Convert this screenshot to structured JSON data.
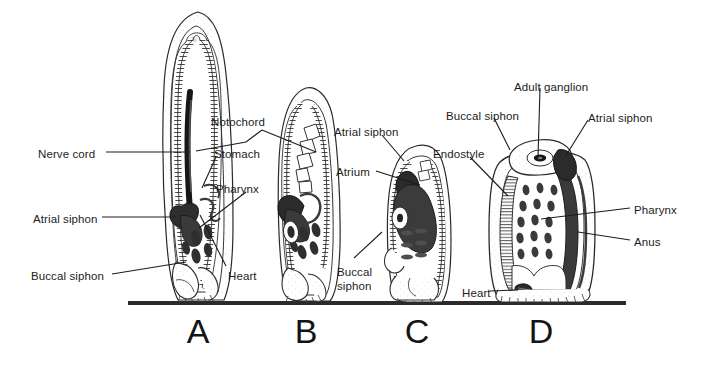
{
  "figure": {
    "type": "scientific-line-diagram",
    "background": "#ffffff",
    "ink": "#1c1c1c",
    "baseline": {
      "x1": 128,
      "x2": 626,
      "y": 303,
      "thickness": 4,
      "color": "#2b2b2b"
    }
  },
  "stages": [
    {
      "letter": "A",
      "cx": 198,
      "y": 312
    },
    {
      "letter": "B",
      "cx": 306,
      "y": 312
    },
    {
      "letter": "C",
      "cx": 417,
      "y": 312
    },
    {
      "letter": "D",
      "cx": 541,
      "y": 312
    }
  ],
  "labels": [
    {
      "id": "nerve-cord",
      "text": "Nerve cord",
      "x": 38,
      "y": 148,
      "align": "left"
    },
    {
      "id": "notochord",
      "text": "Notochord",
      "x": 211,
      "y": 116,
      "align": "left"
    },
    {
      "id": "stomach",
      "text": "Stomach",
      "x": 214,
      "y": 148,
      "align": "left"
    },
    {
      "id": "pharynx-a",
      "text": "Pharynx",
      "x": 216,
      "y": 183,
      "align": "left"
    },
    {
      "id": "atrial-siphon-a",
      "text": "Atrial siphon",
      "x": 33,
      "y": 213,
      "align": "left"
    },
    {
      "id": "buccal-siphon-a",
      "text": "Buccal siphon",
      "x": 31,
      "y": 270,
      "align": "left"
    },
    {
      "id": "heart-a",
      "text": "Heart",
      "x": 228,
      "y": 270,
      "align": "left"
    },
    {
      "id": "atrial-siphon-c",
      "text": "Atrial siphon",
      "x": 334,
      "y": 126,
      "align": "left"
    },
    {
      "id": "atrium-c",
      "text": "Atrium",
      "x": 336,
      "y": 166,
      "align": "left"
    },
    {
      "id": "buccal-siphon-c",
      "text": "Buccal\nsiphon",
      "x": 337,
      "y": 266,
      "align": "left"
    },
    {
      "id": "endostyle-d",
      "text": "Endostyle",
      "x": 433,
      "y": 148,
      "align": "left"
    },
    {
      "id": "buccal-siphon-d",
      "text": "Buccal siphon",
      "x": 446,
      "y": 110,
      "align": "left"
    },
    {
      "id": "adult-ganglion-d",
      "text": "Adult ganglion",
      "x": 514,
      "y": 81,
      "align": "left"
    },
    {
      "id": "atrial-siphon-d",
      "text": "Atrial siphon",
      "x": 588,
      "y": 112,
      "align": "left"
    },
    {
      "id": "pharynx-d",
      "text": "Pharynx",
      "x": 634,
      "y": 204,
      "align": "left"
    },
    {
      "id": "anus-d",
      "text": "Anus",
      "x": 634,
      "y": 236,
      "align": "left"
    },
    {
      "id": "heart-d",
      "text": "Heart",
      "x": 462,
      "y": 287,
      "align": "left"
    }
  ],
  "leaders": [
    {
      "id": "leader-nerve-cord",
      "points": "106,152 190,152"
    },
    {
      "id": "leader-notochord-a",
      "points": "262,130 246,142 196,151"
    },
    {
      "id": "leader-notochord-b",
      "points": "262,130 316,152"
    },
    {
      "id": "leader-stomach",
      "points": "216,157 202,188"
    },
    {
      "id": "leader-pharynx-a",
      "points": "246,192 199,228"
    },
    {
      "id": "leader-atrial-siphon-a",
      "points": "102,217 176,217"
    },
    {
      "id": "leader-buccal-siphon-a",
      "points": "112,274 186,262"
    },
    {
      "id": "leader-heart-a",
      "points": "226,266 200,215"
    },
    {
      "id": "leader-atrial-siphon-c",
      "points": "382,135 404,161"
    },
    {
      "id": "leader-atrium-c",
      "points": "376,171 420,185"
    },
    {
      "id": "leader-buccal-siphon-c",
      "points": "354,258 382,232"
    },
    {
      "id": "leader-endostyle-d",
      "points": "470,157 508,196"
    },
    {
      "id": "leader-buccal-siphon-d",
      "points": "494,118 510,150"
    },
    {
      "id": "leader-adult-ganglion-d",
      "points": "540,88 538,158"
    },
    {
      "id": "leader-atrial-siphon-d",
      "points": "588,120 565,157"
    },
    {
      "id": "leader-pharynx-d",
      "points": "630,208 541,219"
    },
    {
      "id": "leader-anus-d",
      "points": "630,240 578,232"
    },
    {
      "id": "leader-heart-d",
      "points": "490,291 518,290"
    }
  ]
}
